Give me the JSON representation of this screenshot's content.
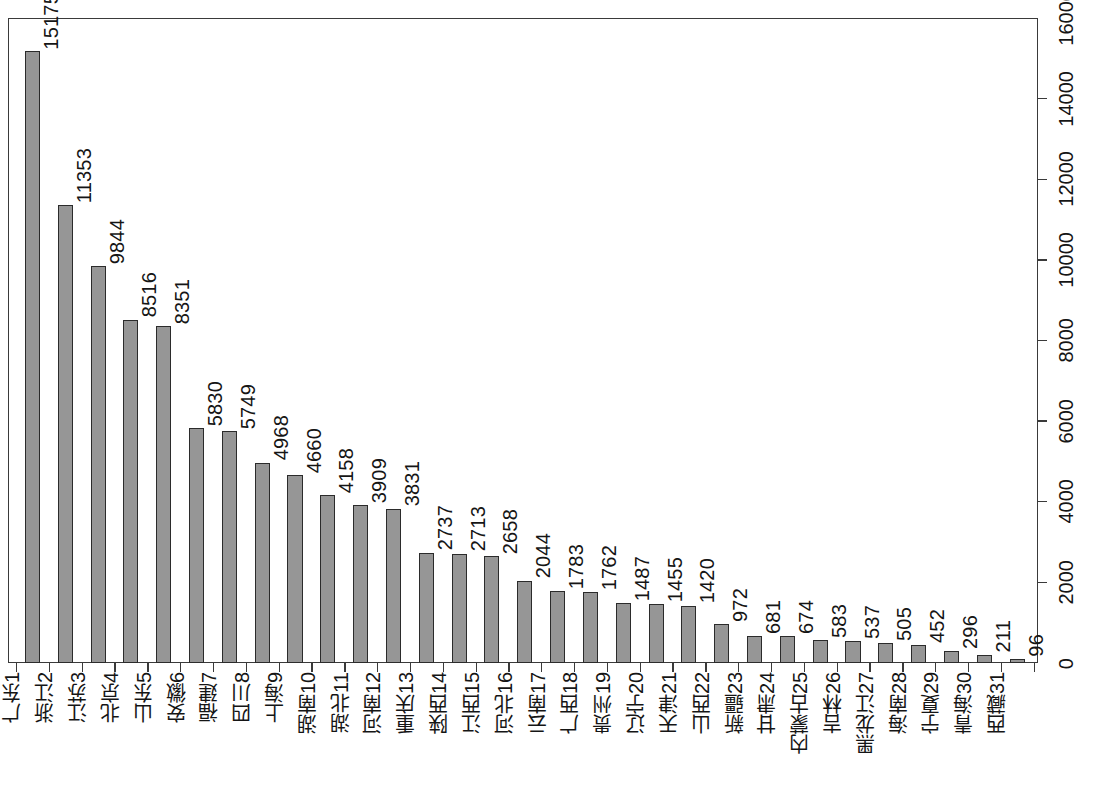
{
  "chart_data": {
    "type": "bar",
    "title": "",
    "subtitle": "",
    "xlabel": "",
    "ylabel": "",
    "orientation": "vertical-bars-rotated-90",
    "grid": false,
    "legend": null,
    "ylim": [
      0,
      16000
    ],
    "ytick_labels": [
      "0",
      "2000",
      "4000",
      "6000",
      "8000",
      "10000",
      "12000",
      "14000",
      "16000"
    ],
    "ytick_values": [
      0,
      2000,
      4000,
      6000,
      8000,
      10000,
      12000,
      14000,
      16000
    ],
    "ranks": [
      1,
      2,
      3,
      4,
      5,
      6,
      7,
      8,
      9,
      10,
      11,
      12,
      13,
      14,
      15,
      16,
      17,
      18,
      19,
      20,
      21,
      22,
      23,
      24,
      25,
      26,
      27,
      28,
      29,
      30,
      31
    ],
    "categories": [
      "广东",
      "浙江",
      "江苏",
      "北京",
      "山东",
      "安徽",
      "福建",
      "四川",
      "上海",
      "湖南",
      "湖北",
      "河南",
      "重庆",
      "陕西",
      "江西",
      "河北",
      "云南",
      "广西",
      "贵州",
      "辽宁",
      "天津",
      "山西",
      "新疆",
      "甘肃",
      "内蒙古",
      "吉林",
      "黑龙江",
      "海南",
      "宁夏",
      "青海",
      "西藏"
    ],
    "values": [
      15175,
      11353,
      9844,
      8516,
      8351,
      5830,
      5749,
      4968,
      4660,
      4158,
      3909,
      3831,
      2737,
      2713,
      2658,
      2044,
      1783,
      1762,
      1487,
      1455,
      1420,
      972,
      681,
      674,
      583,
      537,
      505,
      452,
      296,
      211,
      96
    ],
    "data_labels": [
      "15175",
      "11353",
      "9844",
      "8516",
      "8351",
      "5830",
      "5749",
      "4968",
      "4660",
      "4158",
      "3909",
      "3831",
      "2737",
      "2713",
      "2658",
      "2044",
      "1783",
      "1762",
      "1487",
      "1455",
      "1420",
      "972",
      "681",
      "674",
      "583",
      "537",
      "505",
      "452",
      "296",
      "211",
      "96"
    ],
    "colors": {
      "bar_fill": "#969696",
      "bar_border": "#2b2b2b",
      "axis": "#3a3a3a",
      "text": "#151515",
      "background": "#ffffff"
    }
  }
}
